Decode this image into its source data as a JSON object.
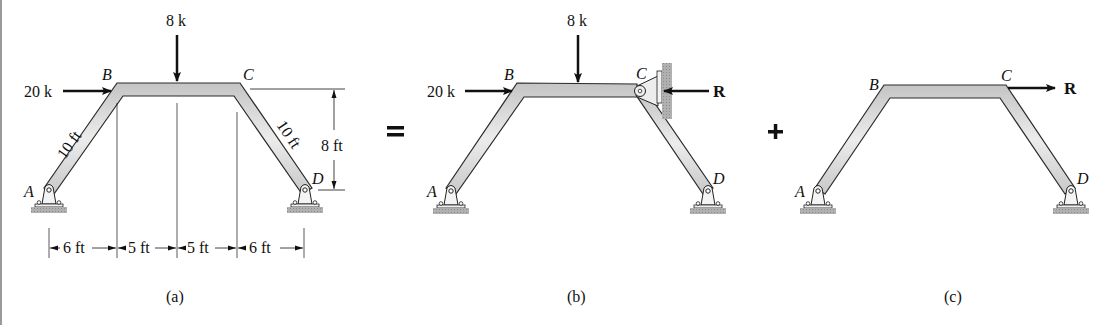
{
  "figure": {
    "operators": {
      "equals": "=",
      "plus": "+"
    },
    "panels": [
      {
        "id": "a",
        "caption": "(a)",
        "nodes": {
          "A": "A",
          "B": "B",
          "C": "C",
          "D": "D"
        },
        "loads": {
          "horizontal": "20 k",
          "vertical": "8 k"
        },
        "dimensions": {
          "member_AB": "10 ft",
          "member_CD": "10 ft",
          "height": "8 ft",
          "spans": [
            "6 ft",
            "5 ft",
            "5 ft",
            "6 ft"
          ]
        }
      },
      {
        "id": "b",
        "caption": "(b)",
        "nodes": {
          "A": "A",
          "B": "B",
          "C": "C",
          "D": "D"
        },
        "loads": {
          "horizontal": "20 k",
          "vertical": "8 k",
          "reaction": "R"
        }
      },
      {
        "id": "c",
        "caption": "(c)",
        "nodes": {
          "A": "A",
          "B": "B",
          "C": "C",
          "D": "D"
        },
        "loads": {
          "reaction": "R"
        }
      }
    ]
  },
  "colors": {
    "member_fill": "#d6d6d6",
    "member_stroke": "#2a2a2a",
    "ground_fill": "#a8a8a8",
    "ink": "#111111",
    "left_rule": "#9a9a9a"
  }
}
